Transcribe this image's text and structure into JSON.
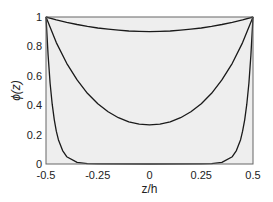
{
  "chart_data": {
    "type": "line",
    "title": "",
    "xlabel": "z/h",
    "ylabel": "ϕ(z)",
    "xlim": [
      -0.5,
      0.5
    ],
    "ylim": [
      0,
      1
    ],
    "x_ticks": [
      -0.5,
      -0.25,
      0,
      0.25,
      0.5
    ],
    "x_tick_labels": [
      "-0.5",
      "-0.25",
      "0",
      "0.25",
      "0.5"
    ],
    "y_ticks": [
      0,
      0.2,
      0.4,
      0.6,
      0.8,
      1
    ],
    "y_tick_labels": [
      "0",
      "0.2",
      "0.4",
      "0.6",
      "0.8",
      "1"
    ],
    "grid": false,
    "legend": null,
    "background_color": "#eeeeee",
    "line_color": "#1a1a1a",
    "series": [
      {
        "name": "weak decay",
        "x": [
          -0.5,
          -0.45,
          -0.4,
          -0.35,
          -0.3,
          -0.25,
          -0.2,
          -0.15,
          -0.1,
          -0.05,
          0,
          0.05,
          0.1,
          0.15,
          0.2,
          0.25,
          0.3,
          0.35,
          0.4,
          0.45,
          0.5
        ],
        "y": [
          1,
          0.981,
          0.964,
          0.949,
          0.936,
          0.925,
          0.917,
          0.91,
          0.905,
          0.902,
          0.901,
          0.902,
          0.905,
          0.91,
          0.917,
          0.925,
          0.936,
          0.949,
          0.964,
          0.981,
          1
        ]
      },
      {
        "name": "moderate decay",
        "x": [
          -0.5,
          -0.45,
          -0.4,
          -0.35,
          -0.3,
          -0.25,
          -0.2,
          -0.15,
          -0.1,
          -0.05,
          0,
          0.05,
          0.1,
          0.15,
          0.2,
          0.25,
          0.3,
          0.35,
          0.4,
          0.45,
          0.5
        ],
        "y": [
          1,
          0.826,
          0.685,
          0.572,
          0.481,
          0.41,
          0.355,
          0.315,
          0.287,
          0.271,
          0.266,
          0.271,
          0.287,
          0.315,
          0.355,
          0.41,
          0.481,
          0.572,
          0.685,
          0.826,
          1
        ]
      },
      {
        "name": "strong decay",
        "x": [
          -0.5,
          -0.49,
          -0.48,
          -0.47,
          -0.46,
          -0.45,
          -0.44,
          -0.42,
          -0.4,
          -0.35,
          -0.3,
          -0.25,
          0,
          0.25,
          0.3,
          0.35,
          0.4,
          0.42,
          0.44,
          0.45,
          0.46,
          0.47,
          0.48,
          0.49,
          0.5
        ],
        "y": [
          1,
          0.741,
          0.549,
          0.407,
          0.301,
          0.223,
          0.165,
          0.091,
          0.05,
          0.011,
          0.0025,
          0.0006,
          0,
          0.0006,
          0.0025,
          0.011,
          0.05,
          0.091,
          0.165,
          0.223,
          0.301,
          0.407,
          0.549,
          0.741,
          1
        ]
      }
    ]
  }
}
